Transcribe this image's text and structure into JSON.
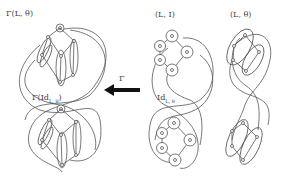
{
  "labels": {
    "gamma_L_theta": "Γ(L, θ)",
    "gamma_id_main": "Γ(Id",
    "gamma_id_sub": "L, θ",
    "gamma_id_close": ")",
    "L_I": "(L, I)",
    "L_theta": "(L, θ)",
    "id_main": "Id",
    "id_sub": "L, θ",
    "arrow_label": "Γ"
  },
  "colors": {
    "stroke": "#555555",
    "arrow": "#111111",
    "text": "#444444"
  }
}
